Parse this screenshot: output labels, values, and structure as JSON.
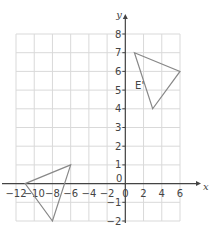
{
  "diagram": {
    "type": "coordinate-grid",
    "x_axis": {
      "name": "x",
      "min": -12,
      "max": 6,
      "tick_step": 2,
      "tick_labels": [
        "-12",
        "-10",
        "-8",
        "-6",
        "-4",
        "-2",
        "0",
        "2",
        "4",
        "6"
      ]
    },
    "y_axis": {
      "name": "y",
      "min": -2,
      "max": 8,
      "tick_step": 1,
      "tick_labels": [
        "-2",
        "-1",
        "0",
        "1",
        "2",
        "3",
        "4",
        "5",
        "6",
        "7",
        "8"
      ]
    },
    "shapes": [
      {
        "name": "triangle-E-prime",
        "label": "E'",
        "vertices": [
          [
            1,
            7
          ],
          [
            6,
            6
          ],
          [
            3,
            4
          ]
        ]
      },
      {
        "name": "triangle-lower-left",
        "label": "",
        "vertices": [
          [
            -11,
            0
          ],
          [
            -6,
            1
          ],
          [
            -8,
            -2
          ]
        ]
      }
    ],
    "colors": {
      "grid": "#d9d9d9",
      "axis": "#444444",
      "shape": "#888888",
      "text": "#444444"
    }
  }
}
